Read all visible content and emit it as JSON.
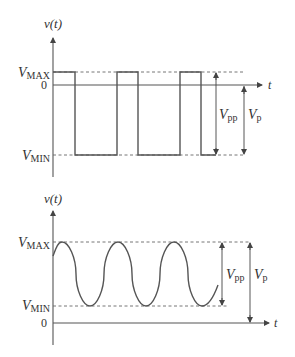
{
  "diagram": {
    "top": {
      "title": "Square wave",
      "y_axis_label": "v(t)",
      "x_axis_label": "t",
      "levels": {
        "vmax": "V",
        "vmax_sub": "MAX",
        "zero": "0",
        "vmin": "V",
        "vmin_sub": "MIN"
      },
      "dimensions": {
        "vpp": "V",
        "vpp_sub": "pp",
        "vp": "V",
        "vp_sub": "p"
      }
    },
    "bottom": {
      "title": "Sine wave with DC offset",
      "y_axis_label": "v(t)",
      "x_axis_label": "t",
      "levels": {
        "vmax": "V",
        "vmax_sub": "MAX",
        "zero": "0",
        "vmin": "V",
        "vmin_sub": "MIN"
      },
      "dimensions": {
        "vpp": "V",
        "vpp_sub": "pp",
        "vp": "V",
        "vp_sub": "p"
      }
    }
  },
  "colors": {
    "line": "#555555",
    "text": "#333333",
    "background": "#ffffff"
  }
}
